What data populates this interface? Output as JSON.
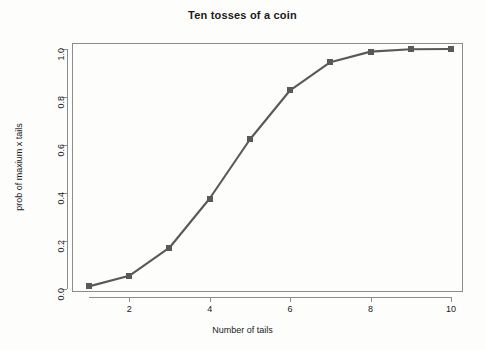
{
  "chart_data": {
    "type": "line",
    "title": "Ten tosses of a coin",
    "xlabel": "Number of tails",
    "ylabel": "prob of maxium x tails",
    "x": [
      1,
      2,
      3,
      4,
      5,
      6,
      7,
      8,
      9,
      10
    ],
    "values": [
      0.011,
      0.055,
      0.172,
      0.377,
      0.623,
      0.828,
      0.945,
      0.989,
      0.999,
      1.0
    ],
    "series": [
      {
        "name": "prob of maxium x tails",
        "values": [
          0.011,
          0.055,
          0.172,
          0.377,
          0.623,
          0.828,
          0.945,
          0.989,
          0.999,
          1.0
        ]
      }
    ],
    "xlim": [
      0.7,
      10.3
    ],
    "ylim": [
      0.0,
      1.0
    ],
    "xticks": [
      2,
      4,
      6,
      8,
      10
    ],
    "xtick_labels": [
      "2",
      "4",
      "6",
      "8",
      "10"
    ],
    "yticks": [
      0.0,
      0.2,
      0.4,
      0.6,
      0.8,
      1.0
    ],
    "ytick_labels": [
      "0.0",
      "0.2",
      "0.4",
      "0.6",
      "0.8",
      "1.0"
    ],
    "grid": false,
    "legend": false,
    "marker": "square",
    "line_color": "#595959",
    "marker_color": "#595959",
    "axis_color": "#8c8c8c",
    "background_color": "#fdfdfc",
    "text_color": "#1a1a1a"
  }
}
